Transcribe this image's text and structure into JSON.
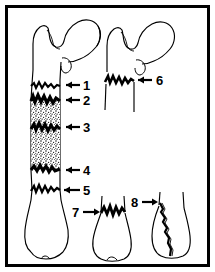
{
  "figure": {
    "frame": {
      "border_color": "#000000",
      "background_color": "#ffffff",
      "border_width_px": 3
    },
    "ink_color": "#000000",
    "stipple_color": "#000000"
  },
  "labels": [
    {
      "id": "1",
      "text": "1",
      "x": 83,
      "y": 79,
      "arrow": {
        "tail_x": 80,
        "tip_x": 62,
        "y": 85
      }
    },
    {
      "id": "2",
      "text": "2",
      "x": 83,
      "y": 94,
      "arrow": {
        "tail_x": 80,
        "tip_x": 62,
        "y": 100
      }
    },
    {
      "id": "3",
      "text": "3",
      "x": 83,
      "y": 121,
      "arrow": {
        "tail_x": 80,
        "tip_x": 62,
        "y": 127
      }
    },
    {
      "id": "4",
      "text": "4",
      "x": 83,
      "y": 164,
      "arrow": {
        "tail_x": 80,
        "tip_x": 62,
        "y": 170
      }
    },
    {
      "id": "5",
      "text": "5",
      "x": 83,
      "y": 184,
      "arrow": {
        "tail_x": 80,
        "tip_x": 62,
        "y": 190
      }
    },
    {
      "id": "6",
      "text": "6",
      "x": 156,
      "y": 74,
      "arrow": {
        "tail_x": 152,
        "tip_x": 134,
        "y": 80
      }
    },
    {
      "id": "7",
      "text": "7",
      "x": 72,
      "y": 206,
      "arrow": {
        "tail_x": 82,
        "tip_x": 100,
        "y": 212
      }
    },
    {
      "id": "8",
      "text": "8",
      "x": 131,
      "y": 196,
      "arrow": {
        "tail_x": 141,
        "tip_x": 157,
        "y": 202
      }
    }
  ],
  "bones": [
    {
      "name": "left-femur-whole",
      "role": "Full-length femur with multiple fracture lines and comminuted zone",
      "fractures": [
        "transverse",
        "comminuted-upper",
        "segmental-stippled",
        "comminuted-lower",
        "transverse-lower"
      ]
    },
    {
      "name": "right-proximal-femur",
      "role": "Proximal femur fragment showing subtrochanteric fracture",
      "fractures": [
        "subtrochanteric"
      ]
    },
    {
      "name": "center-distal-femur",
      "role": "Distal femur fragment showing supracondylar fracture",
      "fractures": [
        "supracondylar"
      ]
    },
    {
      "name": "right-distal-femur",
      "role": "Distal femur fragment showing intercondylar oblique fracture",
      "fractures": [
        "intercondylar-oblique"
      ]
    }
  ]
}
